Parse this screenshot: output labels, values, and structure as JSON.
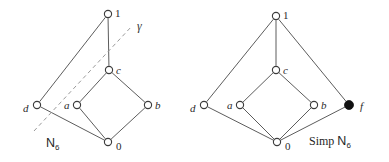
{
  "figure": {
    "background_color": "#ffffff",
    "edge_color": "#4a4a4a",
    "node_stroke_color": "#3c3c3c",
    "node_fill_open": "#ffffff",
    "node_fill_closed": "#111111",
    "dashed_color": "#9a9a9a",
    "text_color": "#1f1f1f"
  },
  "diagrams": [
    {
      "id": "n6",
      "caption": {
        "base": "N",
        "subscript": "6",
        "x": 46,
        "y": 147
      },
      "nodes": [
        {
          "id": "one",
          "label": "1",
          "kind": "open",
          "x": 108,
          "y": 14,
          "label_x": 115,
          "label_y": 13
        },
        {
          "id": "c",
          "label": "c",
          "kind": "open",
          "x": 109,
          "y": 70,
          "label_x": 116,
          "label_y": 70
        },
        {
          "id": "d",
          "label": "d",
          "kind": "open",
          "x": 37,
          "y": 105,
          "label_x": 23,
          "label_y": 108
        },
        {
          "id": "a",
          "label": "a",
          "kind": "open",
          "x": 77,
          "y": 105,
          "label_x": 64,
          "label_y": 105
        },
        {
          "id": "b",
          "label": "b",
          "kind": "open",
          "x": 148,
          "y": 105,
          "label_x": 155,
          "label_y": 105
        },
        {
          "id": "zero",
          "label": "0",
          "kind": "open",
          "x": 108,
          "y": 142,
          "label_x": 116,
          "label_y": 146
        }
      ],
      "edges": [
        {
          "from": "d",
          "to": "one"
        },
        {
          "from": "one",
          "to": "c"
        },
        {
          "from": "c",
          "to": "a"
        },
        {
          "from": "c",
          "to": "b"
        },
        {
          "from": "a",
          "to": "zero"
        },
        {
          "from": "b",
          "to": "zero"
        },
        {
          "from": "d",
          "to": "zero"
        }
      ],
      "dashed_lines": [
        {
          "id": "gamma-line",
          "x1": 34,
          "y1": 131,
          "x2": 132,
          "y2": 26
        }
      ],
      "annotations": [
        {
          "id": "gamma",
          "text": "γ",
          "x": 137,
          "y": 30
        }
      ]
    },
    {
      "id": "simp-n6",
      "caption": {
        "prefix": "Simp ",
        "base": "N",
        "subscript": "6",
        "x": 309,
        "y": 145
      },
      "nodes": [
        {
          "id": "one",
          "label": "1",
          "kind": "open",
          "x": 276,
          "y": 16,
          "label_x": 283,
          "label_y": 15
        },
        {
          "id": "c",
          "label": "c",
          "kind": "open",
          "x": 276,
          "y": 70,
          "label_x": 283,
          "label_y": 70
        },
        {
          "id": "d",
          "label": "d",
          "kind": "open",
          "x": 204,
          "y": 105,
          "label_x": 190,
          "label_y": 108
        },
        {
          "id": "a",
          "label": "a",
          "kind": "open",
          "x": 240,
          "y": 105,
          "label_x": 227,
          "label_y": 105
        },
        {
          "id": "b",
          "label": "b",
          "kind": "open",
          "x": 314,
          "y": 105,
          "label_x": 321,
          "label_y": 105
        },
        {
          "id": "f",
          "label": "f",
          "kind": "closed",
          "x": 349,
          "y": 105,
          "label_x": 360,
          "label_y": 106
        },
        {
          "id": "zero",
          "label": "0",
          "kind": "open",
          "x": 277,
          "y": 142,
          "label_x": 285,
          "label_y": 146
        }
      ],
      "edges": [
        {
          "from": "d",
          "to": "one"
        },
        {
          "from": "one",
          "to": "c"
        },
        {
          "from": "one",
          "to": "f"
        },
        {
          "from": "c",
          "to": "a"
        },
        {
          "from": "c",
          "to": "b"
        },
        {
          "from": "a",
          "to": "zero"
        },
        {
          "from": "b",
          "to": "zero"
        },
        {
          "from": "d",
          "to": "zero"
        },
        {
          "from": "f",
          "to": "zero"
        }
      ],
      "dashed_lines": [],
      "annotations": []
    }
  ]
}
